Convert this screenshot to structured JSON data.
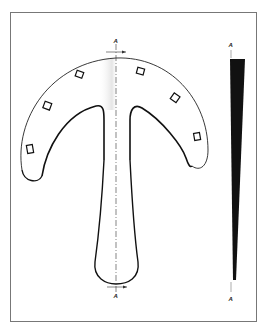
{
  "diagram": {
    "type": "technical-drawing",
    "section_labels": {
      "top_main": "A",
      "bottom_main": "A",
      "top_profile": "A",
      "bottom_profile": "A"
    },
    "holes_count": 6,
    "colors": {
      "outline": "#111111",
      "profile_fill": "#111111",
      "frame": "#777777",
      "shading": "#e4e4e4"
    }
  }
}
